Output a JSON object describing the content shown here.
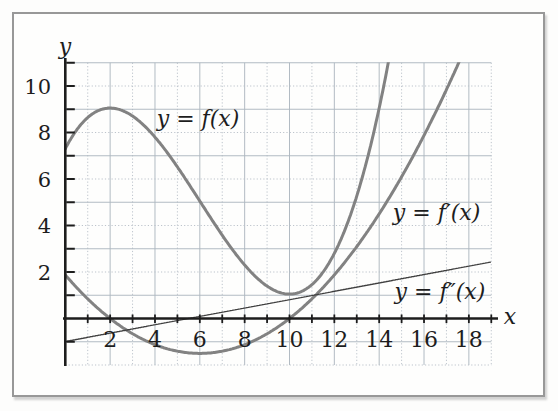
{
  "figure": {
    "background": "#fdfdfc",
    "frame_border_color": "#989898"
  },
  "chart_data": {
    "type": "line",
    "title": "",
    "xlabel": "x",
    "ylabel": "y",
    "xlim": [
      0,
      19
    ],
    "ylim": [
      -2,
      11
    ],
    "x_tick_step": 1,
    "y_tick_step": 1,
    "x_axis_labels": [
      "2",
      "4",
      "6",
      "8",
      "10",
      "12",
      "14",
      "16",
      "18"
    ],
    "y_axis_labels": [
      "2",
      "4",
      "6",
      "8",
      "10"
    ],
    "grid": {
      "on": true,
      "spacing": 1,
      "style": "alternating solid and dotted unit lines",
      "color_solid": "#aeb7c0",
      "color_dotted": "#b9c1c9"
    },
    "axis_color": "#1d1d1d",
    "legend_position": "labels beside curves",
    "series": [
      {
        "name": "f",
        "label": "y = f(x)",
        "color": "#828282",
        "stroke_width": 3,
        "poly_coeffs": [
          0.03125,
          -0.5625,
          1.875,
          7.3
        ],
        "domain": [
          0,
          15
        ],
        "label_anchor": [
          5.92,
          8.26
        ],
        "x": [
          0,
          1,
          2,
          3,
          4,
          5,
          6,
          7,
          8,
          9,
          10,
          11,
          12,
          13,
          14
        ],
        "y": [
          7.3,
          8.64,
          9.05,
          8.71,
          7.8,
          6.52,
          5.05,
          3.58,
          2.3,
          1.39,
          1.05,
          1.46,
          2.8,
          5.27,
          9.05
        ],
        "local_max": [
          2,
          9.05
        ],
        "local_min": [
          10,
          1.05
        ]
      },
      {
        "name": "f_prime",
        "label": "y = f′(x)",
        "color": "#828282",
        "stroke_width": 3,
        "poly_coeffs": [
          0,
          0.09375,
          -1.125,
          1.875
        ],
        "domain": [
          0,
          18
        ],
        "label_anchor": [
          16.56,
          4.24
        ],
        "x": [
          0,
          1,
          2,
          3,
          4,
          5,
          6,
          7,
          8,
          9,
          10,
          11,
          12,
          13,
          14,
          15,
          16,
          17
        ],
        "y": [
          1.88,
          0.84,
          0,
          -0.66,
          -1.13,
          -1.41,
          -1.5,
          -1.41,
          -1.13,
          -0.66,
          0,
          0.84,
          1.88,
          3.09,
          4.5,
          6.09,
          7.88,
          9.84
        ],
        "zeros": [
          2,
          10
        ],
        "local_min": [
          6,
          -1.5
        ]
      },
      {
        "name": "f_double_prime",
        "label": "y = f″(x)",
        "color": "#3f3f3f",
        "stroke_width": 1.3,
        "poly_coeffs": [
          0,
          0,
          0.18,
          -0.99
        ],
        "domain": [
          0,
          19
        ],
        "label_anchor": [
          16.71,
          0.84
        ],
        "x": [
          0,
          2,
          4,
          6,
          8,
          10,
          12,
          14,
          16,
          18
        ],
        "y": [
          -0.99,
          -0.63,
          -0.27,
          0.09,
          0.45,
          0.81,
          1.17,
          1.53,
          1.89,
          2.25
        ],
        "zeros": [
          5.5
        ]
      }
    ]
  }
}
